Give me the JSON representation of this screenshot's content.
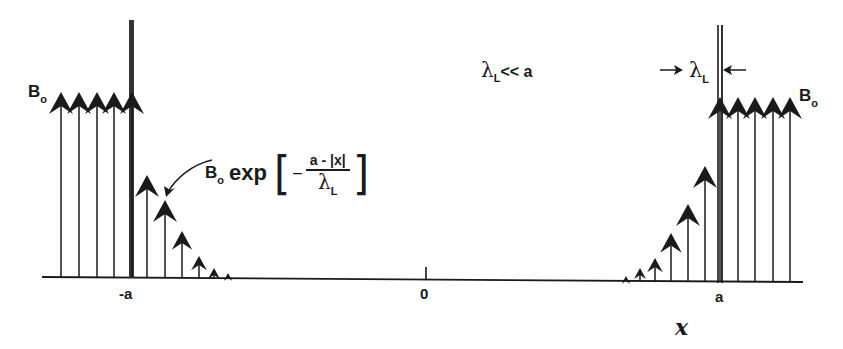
{
  "diagram": {
    "labels": {
      "b0_left": "B",
      "b0_left_sub": "o",
      "b0_right": "B",
      "b0_right_sub": "o",
      "formula_prefix": "B",
      "formula_prefix_sub": "o",
      "formula_exp": "exp",
      "formula_open_bracket": "[",
      "formula_minus": "–",
      "formula_numerator": "a - |x|",
      "formula_denominator": "λ",
      "formula_denominator_sub": "L",
      "formula_close_bracket": "]",
      "condition": "λ",
      "condition_sub": "L",
      "condition_rest": "<< a",
      "penetration_depth": "λ",
      "penetration_depth_sub": "L",
      "axis_neg_a": "-a",
      "axis_zero": "0",
      "axis_pos_a": "a",
      "axis_x": "x"
    },
    "axis": {
      "y_left": 277,
      "y_right": 282,
      "x_start": 42,
      "x_end": 803
    },
    "walls": [
      {
        "name": "left-wall",
        "x": 131,
        "top": 20,
        "style": "solid-thick"
      },
      {
        "name": "right-wall",
        "x": 720,
        "top": 25,
        "style": "double-line"
      }
    ],
    "arrows_left_outside": [
      {
        "x": 61,
        "tip": 92
      },
      {
        "x": 79,
        "tip": 92
      },
      {
        "x": 97,
        "tip": 92
      },
      {
        "x": 114,
        "tip": 92
      },
      {
        "x": 132,
        "tip": 92
      }
    ],
    "arrows_left_decay": [
      {
        "x": 147,
        "tip": 175,
        "size": 1.0
      },
      {
        "x": 165,
        "tip": 200,
        "size": 1.0
      },
      {
        "x": 182,
        "tip": 231,
        "size": 0.85
      },
      {
        "x": 199,
        "tip": 256,
        "size": 0.65
      },
      {
        "x": 214,
        "tip": 268,
        "size": 0.5
      },
      {
        "x": 228,
        "tip": 273,
        "size": 0.35
      }
    ],
    "arrows_right_outside": [
      {
        "x": 720,
        "tip": 97
      },
      {
        "x": 738,
        "tip": 97
      },
      {
        "x": 755,
        "tip": 97
      },
      {
        "x": 773,
        "tip": 97
      },
      {
        "x": 790,
        "tip": 97
      }
    ],
    "arrows_right_decay": [
      {
        "x": 705,
        "tip": 166,
        "size": 1.0
      },
      {
        "x": 688,
        "tip": 204,
        "size": 1.0
      },
      {
        "x": 671,
        "tip": 233,
        "size": 0.9
      },
      {
        "x": 655,
        "tip": 258,
        "size": 0.65
      },
      {
        "x": 640,
        "tip": 268,
        "size": 0.5
      },
      {
        "x": 626,
        "tip": 276,
        "size": 0.35
      }
    ],
    "colors": {
      "ink": "#1a1a1a",
      "background": "#ffffff"
    }
  }
}
